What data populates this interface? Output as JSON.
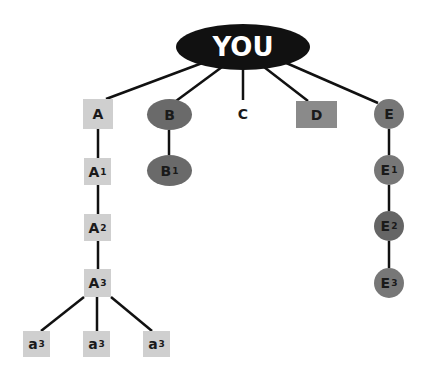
{
  "diagram": {
    "type": "tree",
    "root": {
      "label": "YOU"
    },
    "nodes": {
      "A": {
        "label": "A",
        "sub": ""
      },
      "A1": {
        "label": "A",
        "sub": "1"
      },
      "A2": {
        "label": "A",
        "sub": "2"
      },
      "A3": {
        "label": "A",
        "sub": "3"
      },
      "a3_left": {
        "label": "a",
        "sub": "3"
      },
      "a3_mid": {
        "label": "a",
        "sub": "3"
      },
      "a3_right": {
        "label": "a",
        "sub": "3"
      },
      "B": {
        "label": "B",
        "sub": ""
      },
      "B1": {
        "label": "B",
        "sub": "1"
      },
      "C": {
        "label": "C",
        "sub": ""
      },
      "D": {
        "label": "D",
        "sub": ""
      },
      "E": {
        "label": "E",
        "sub": ""
      },
      "E1": {
        "label": "E",
        "sub": "1"
      },
      "E2": {
        "label": "E",
        "sub": "2"
      },
      "E3": {
        "label": "E",
        "sub": "3"
      }
    },
    "edges": [
      [
        "YOU",
        "A"
      ],
      [
        "YOU",
        "B"
      ],
      [
        "YOU",
        "C"
      ],
      [
        "YOU",
        "D"
      ],
      [
        "YOU",
        "E"
      ],
      [
        "A",
        "A1"
      ],
      [
        "A1",
        "A2"
      ],
      [
        "A2",
        "A3"
      ],
      [
        "A3",
        "a3_left"
      ],
      [
        "A3",
        "a3_mid"
      ],
      [
        "A3",
        "a3_right"
      ],
      [
        "B",
        "B1"
      ],
      [
        "E",
        "E1"
      ],
      [
        "E1",
        "E2"
      ],
      [
        "E2",
        "E3"
      ]
    ],
    "colors": {
      "root": "#111111",
      "square_light": "#cfcfcf",
      "square_dark": "#8a8a8a",
      "ellipse": "#6a6a6a",
      "circle": "#777777",
      "line": "#111111"
    }
  }
}
